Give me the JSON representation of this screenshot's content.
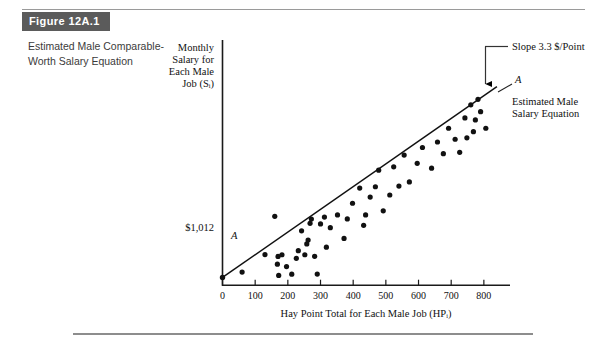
{
  "figure": {
    "badge_label": "Figure 12A.1",
    "caption": "Estimated Male Comparable-Worth Salary Equation"
  },
  "chart_data": {
    "type": "scatter",
    "title": "",
    "xlabel": "Hay Point Total for Each Male Job (HPᵢ)",
    "ylabel": "Monthly Salary for Each Male Job (Sᵢ)",
    "ylabel_lines": [
      "Monthly",
      "Salary for",
      "Each Male",
      "Job (Sᵢ)"
    ],
    "xlabel_main": "Hay Point Total for Each Male Job (",
    "xlabel_sym": "HP",
    "xlabel_sub": "i",
    "xlabel_close": ")",
    "xticks": [
      0,
      100,
      200,
      300,
      400,
      500,
      600,
      700,
      800
    ],
    "xtick_labels": [
      "0",
      "100",
      "200",
      "300",
      "400",
      "500",
      "600",
      "700",
      "800"
    ],
    "xlim": [
      0,
      880
    ],
    "ylim": [
      900,
      4200
    ],
    "yticks": [],
    "grid": false,
    "legend": "none",
    "intercept_label": "$1,012",
    "intercept_value": 1012,
    "slope_value": 3.3,
    "annotations": [
      {
        "name": "slope-annotation",
        "text": "Slope 3.3 $/Point"
      },
      {
        "name": "line-label-left",
        "text": "A"
      },
      {
        "name": "line-label-right",
        "text": "A"
      },
      {
        "name": "line-caption",
        "lines": [
          "Estimated Male",
          "Salary Equation"
        ]
      }
    ],
    "fit_line": {
      "name": "Estimated Male Salary Equation",
      "x0": 0,
      "y0": 1012,
      "x1": 840,
      "y1": 3784
    },
    "points": [
      {
        "x": 60,
        "y": 1090
      },
      {
        "x": 130,
        "y": 1345
      },
      {
        "x": 160,
        "y": 1900
      },
      {
        "x": 168,
        "y": 1205
      },
      {
        "x": 170,
        "y": 1318
      },
      {
        "x": 172,
        "y": 1042
      },
      {
        "x": 182,
        "y": 1342
      },
      {
        "x": 196,
        "y": 1170
      },
      {
        "x": 212,
        "y": 1060
      },
      {
        "x": 226,
        "y": 1290
      },
      {
        "x": 232,
        "y": 1402
      },
      {
        "x": 242,
        "y": 1690
      },
      {
        "x": 252,
        "y": 1342
      },
      {
        "x": 258,
        "y": 1500
      },
      {
        "x": 262,
        "y": 1555
      },
      {
        "x": 268,
        "y": 1798
      },
      {
        "x": 272,
        "y": 1860
      },
      {
        "x": 282,
        "y": 1320
      },
      {
        "x": 290,
        "y": 1062
      },
      {
        "x": 300,
        "y": 1790
      },
      {
        "x": 312,
        "y": 1890
      },
      {
        "x": 318,
        "y": 1452
      },
      {
        "x": 330,
        "y": 1735
      },
      {
        "x": 352,
        "y": 1920
      },
      {
        "x": 372,
        "y": 1580
      },
      {
        "x": 382,
        "y": 1862
      },
      {
        "x": 398,
        "y": 2090
      },
      {
        "x": 420,
        "y": 2310
      },
      {
        "x": 432,
        "y": 1770
      },
      {
        "x": 438,
        "y": 1920
      },
      {
        "x": 452,
        "y": 2180
      },
      {
        "x": 468,
        "y": 2330
      },
      {
        "x": 478,
        "y": 2570
      },
      {
        "x": 492,
        "y": 1980
      },
      {
        "x": 512,
        "y": 2210
      },
      {
        "x": 524,
        "y": 2620
      },
      {
        "x": 540,
        "y": 2340
      },
      {
        "x": 556,
        "y": 2790
      },
      {
        "x": 572,
        "y": 2400
      },
      {
        "x": 596,
        "y": 2670
      },
      {
        "x": 612,
        "y": 2900
      },
      {
        "x": 640,
        "y": 2600
      },
      {
        "x": 658,
        "y": 2980
      },
      {
        "x": 676,
        "y": 2810
      },
      {
        "x": 692,
        "y": 3180
      },
      {
        "x": 712,
        "y": 3020
      },
      {
        "x": 726,
        "y": 2830
      },
      {
        "x": 742,
        "y": 3330
      },
      {
        "x": 748,
        "y": 3040
      },
      {
        "x": 760,
        "y": 3520
      },
      {
        "x": 768,
        "y": 3130
      },
      {
        "x": 774,
        "y": 3300
      },
      {
        "x": 782,
        "y": 3600
      },
      {
        "x": 790,
        "y": 3420
      },
      {
        "x": 806,
        "y": 3180
      }
    ]
  }
}
